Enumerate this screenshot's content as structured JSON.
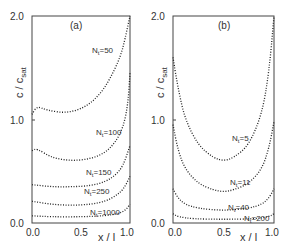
{
  "chart_data": [
    {
      "type": "line",
      "panel_label": "(a)",
      "xlabel": "x/l",
      "ylabel": "c/c_sat",
      "xlim": [
        0.0,
        1.0
      ],
      "ylim": [
        0.0,
        2.0
      ],
      "x_ticks": [
        "0.0",
        "0.5",
        "1.0"
      ],
      "y_ticks": [
        "0.0",
        "1.0",
        "2.0"
      ],
      "grid": false,
      "series": [
        {
          "name": "N_t=50",
          "x": [
            0.0,
            0.05,
            0.15,
            0.35,
            0.55,
            0.7,
            0.8,
            0.9,
            0.95,
            1.0
          ],
          "values": [
            1.05,
            1.13,
            1.09,
            1.06,
            1.12,
            1.25,
            1.4,
            1.6,
            1.78,
            2.0
          ]
        },
        {
          "name": "N_t=100",
          "x": [
            0.0,
            0.05,
            0.2,
            0.4,
            0.6,
            0.75,
            0.85,
            0.93,
            0.98,
            1.0
          ],
          "values": [
            0.7,
            0.72,
            0.63,
            0.6,
            0.62,
            0.68,
            0.78,
            0.92,
            1.15,
            1.45
          ]
        },
        {
          "name": "N_t=150",
          "x": [
            0.0,
            0.2,
            0.4,
            0.6,
            0.75,
            0.85,
            0.93,
            1.0
          ],
          "values": [
            0.37,
            0.35,
            0.35,
            0.36,
            0.4,
            0.46,
            0.55,
            0.75
          ]
        },
        {
          "name": "N_t=250",
          "x": [
            0.0,
            0.2,
            0.4,
            0.6,
            0.75,
            0.85,
            0.93,
            1.0
          ],
          "values": [
            0.21,
            0.18,
            0.17,
            0.18,
            0.21,
            0.26,
            0.32,
            0.45
          ]
        },
        {
          "name": "N_t=1000",
          "x": [
            0.0,
            0.2,
            0.5,
            0.75,
            0.88,
            0.95,
            1.0
          ],
          "values": [
            0.07,
            0.06,
            0.06,
            0.07,
            0.09,
            0.12,
            0.18
          ]
        }
      ]
    },
    {
      "type": "line",
      "panel_label": "(b)",
      "xlabel": "x/l",
      "ylabel": "c/c_sat",
      "xlim": [
        0.0,
        1.0
      ],
      "ylim": [
        0.0,
        2.0
      ],
      "x_ticks": [
        "0.0",
        "0.5",
        "1.0"
      ],
      "y_ticks": [
        "0.0",
        "1.0",
        "2.0"
      ],
      "grid": false,
      "series": [
        {
          "name": "N_t=5",
          "x": [
            0.0,
            0.05,
            0.12,
            0.25,
            0.4,
            0.5,
            0.6,
            0.75,
            0.88,
            0.95,
            1.0
          ],
          "values": [
            1.6,
            1.3,
            1.0,
            0.75,
            0.63,
            0.6,
            0.63,
            0.75,
            1.05,
            1.45,
            2.0
          ]
        },
        {
          "name": "N_t=11",
          "x": [
            0.0,
            0.05,
            0.12,
            0.25,
            0.4,
            0.5,
            0.6,
            0.75,
            0.88,
            0.95,
            1.0
          ],
          "values": [
            0.95,
            0.7,
            0.52,
            0.38,
            0.32,
            0.3,
            0.32,
            0.38,
            0.52,
            0.72,
            0.98
          ]
        },
        {
          "name": "N_t=40",
          "x": [
            0.0,
            0.05,
            0.12,
            0.25,
            0.5,
            0.75,
            0.88,
            0.95,
            1.0
          ],
          "values": [
            0.33,
            0.24,
            0.18,
            0.14,
            0.12,
            0.14,
            0.18,
            0.24,
            0.33
          ]
        },
        {
          "name": "N_t=200",
          "x": [
            0.0,
            0.05,
            0.2,
            0.5,
            0.8,
            0.95,
            1.0
          ],
          "values": [
            0.09,
            0.06,
            0.04,
            0.035,
            0.04,
            0.06,
            0.09
          ]
        }
      ]
    }
  ],
  "labels": {
    "a": {
      "panel": "(a)",
      "ylabel_main": "c / c",
      "ylabel_sub": "sat",
      "xlabel": "x / l",
      "y0": "0.0",
      "y1": "1.0",
      "y2": "2.0",
      "x0": "0.0",
      "x1": "0.5",
      "x2": "1.0",
      "n50": "N",
      "n50v": "=50",
      "n100": "N",
      "n100v": "=100",
      "n150": "N",
      "n150v": "=150",
      "n250": "N",
      "n250v": "=250",
      "n1000": "N",
      "n1000v": "=1000",
      "sub": "t"
    },
    "b": {
      "panel": "(b)",
      "ylabel_main": "c / c",
      "ylabel_sub": "sat",
      "xlabel": "x / l",
      "y0": "0.0",
      "y1": "1.0",
      "y2": "2.0",
      "x0": "0.0",
      "x1": "0.5",
      "x2": "1.0",
      "n5": "N",
      "n5v": "=5",
      "n11": "N",
      "n11v": "=11",
      "n40": "N",
      "n40v": "=40",
      "n200": "N",
      "n200v": "=200",
      "sub": "t"
    }
  }
}
